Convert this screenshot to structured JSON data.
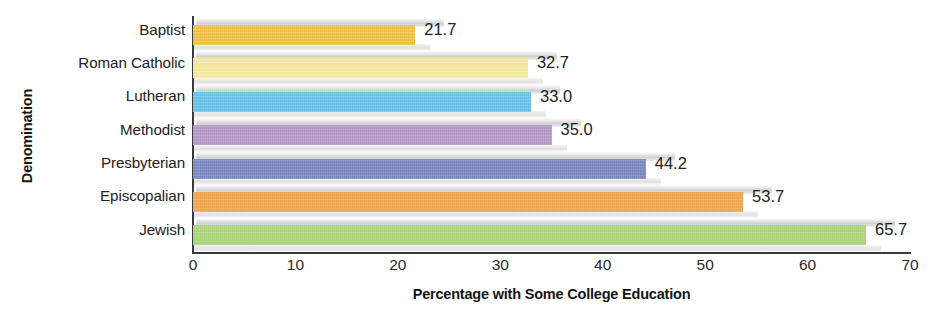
{
  "chart_data": {
    "type": "bar",
    "orientation": "horizontal",
    "title": "",
    "xlabel": "Percentage with Some College Education",
    "ylabel": "Denomination",
    "categories": [
      "Baptist",
      "Roman Catholic",
      "Lutheran",
      "Methodist",
      "Presbyterian",
      "Episcopalian",
      "Jewish"
    ],
    "values": [
      21.7,
      32.7,
      33.0,
      35.0,
      44.2,
      53.7,
      65.7
    ],
    "value_labels": [
      "21.7",
      "32.7",
      "33.0",
      "35.0",
      "44.2",
      "53.7",
      "65.7"
    ],
    "colors": [
      "#F3C54E",
      "#FAEFA4",
      "#6CC4EC",
      "#B79AC9",
      "#7C8AC4",
      "#F5A94F",
      "#ADD87E"
    ],
    "xlim": [
      0,
      70
    ],
    "xticks": [
      0,
      10,
      20,
      30,
      40,
      50,
      60,
      70
    ],
    "xtick_labels": [
      "0",
      "10",
      "20",
      "30",
      "40",
      "50",
      "60",
      "70"
    ],
    "grid": false,
    "legend": "none"
  }
}
